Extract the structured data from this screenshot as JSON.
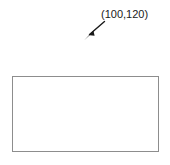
{
  "diagram": {
    "background_color": "#ffffff",
    "annotation": {
      "label": "(100,120)",
      "text_color": "#1a1a1a"
    },
    "arrow": {
      "icon": "arrow-southwest-icon",
      "color": "#1a1a1a",
      "direction": "down-left"
    },
    "rectangle": {
      "stroke_color": "#8d8d8d",
      "fill_color": "#ffffff"
    }
  }
}
